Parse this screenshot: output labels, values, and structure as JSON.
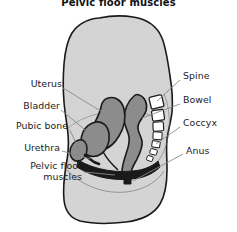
{
  "figure": {
    "title": "Pelvic floor muscles",
    "type": "anatomical-diagram",
    "view": "sagittal-section",
    "colors": {
      "background": "#ffffff",
      "body_fill": "#d4d4d4",
      "body_stroke": "#1a1a1a",
      "organ_fill": "#8c8c8c",
      "organ_stroke": "#1a1a1a",
      "bone_fill": "#ffffff",
      "bone_stroke": "#1a1a1a",
      "muscle_fill": "#1a1a1a",
      "leader_line": "#8a8a8a",
      "text": "#1c1c1c"
    },
    "labels_left": [
      {
        "id": "uterus",
        "text": "Uterus",
        "x": 18,
        "y": 84,
        "lines": 1
      },
      {
        "id": "bladder",
        "text": "Bladder",
        "x": 12,
        "y": 106,
        "lines": 1
      },
      {
        "id": "pubic-bone",
        "text": "Pubic bone",
        "x": 3,
        "y": 126,
        "lines": 1
      },
      {
        "id": "urethra",
        "text": "Urethra",
        "x": 16,
        "y": 147,
        "lines": 1
      },
      {
        "id": "pelvic-floor",
        "text": "Pelvic floor muscles",
        "x": 2,
        "y": 166,
        "lines": 2
      }
    ],
    "labels_right": [
      {
        "id": "spine",
        "text": "Spine",
        "x": 183,
        "y": 76,
        "lines": 1
      },
      {
        "id": "bowel",
        "text": "Bowel",
        "x": 183,
        "y": 100,
        "lines": 1
      },
      {
        "id": "coccyx",
        "text": "Coccyx",
        "x": 183,
        "y": 123,
        "lines": 1
      },
      {
        "id": "anus",
        "text": "Anus",
        "x": 186,
        "y": 150,
        "lines": 1
      }
    ]
  }
}
